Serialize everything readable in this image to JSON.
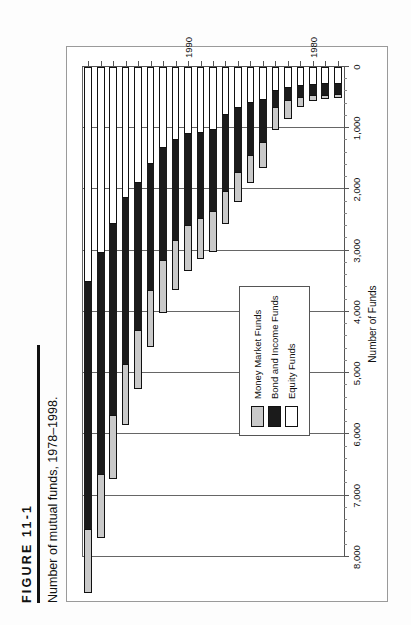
{
  "figure": {
    "number": "FIGURE 11-1",
    "caption": "Number of mutual funds, 1978–1998."
  },
  "legend": {
    "items": [
      {
        "label": "Money Market Funds",
        "color": "#c9c9c9"
      },
      {
        "label": "Bond and Income Funds",
        "color": "#1b1b1b"
      },
      {
        "label": "Equity Funds",
        "color": "#ffffff"
      }
    ]
  },
  "axes": {
    "value_title": "Number of Funds",
    "value_ticks": [
      "0",
      "1,000",
      "2,000",
      "3,000",
      "4,000",
      "5,000",
      "6,000",
      "7,000",
      "8,000"
    ],
    "category_ticks": [
      "1980",
      "1990"
    ]
  },
  "chart_data": {
    "type": "bar",
    "orientation": "horizontal",
    "stacked": true,
    "title": "Number of mutual funds, 1978–1998.",
    "xlabel": "Number of Funds",
    "ylabel": "",
    "xlim": [
      0,
      8000
    ],
    "grid": "vertical",
    "legend_position": "inside-left",
    "categories": [
      "1978",
      "1979",
      "1980",
      "1981",
      "1982",
      "1983",
      "1984",
      "1985",
      "1986",
      "1987",
      "1988",
      "1989",
      "1990",
      "1991",
      "1992",
      "1993",
      "1994",
      "1995",
      "1996",
      "1997",
      "1998"
    ],
    "series": [
      {
        "name": "Equity Funds",
        "color": "#ffffff",
        "values": [
          280,
          283,
          288,
          306,
          340,
          396,
          538,
          582,
          674,
          782,
          1026,
          1069,
          1100,
          1191,
          1325,
          1589,
          1892,
          2139,
          2570,
          3033,
          3513
        ]
      },
      {
        "name": "Bond and Income Funds",
        "color": "#1b1b1b",
        "values": [
          164,
          170,
          170,
          180,
          199,
          257,
          679,
          859,
          1041,
          1241,
          1327,
          1402,
          1486,
          1629,
          1826,
          2055,
          2398,
          2716,
          3106,
          3610,
          4031
        ]
      },
      {
        "name": "Money Market Funds",
        "color": "#c9c9c9",
        "values": [
          61,
          76,
          96,
          159,
          318,
          373,
          425,
          460,
          485,
          543,
          663,
          664,
          743,
          820,
          864,
          920,
          963,
          997,
          1043,
          1048,
          1045
        ]
      }
    ],
    "totals": [
      505,
      529,
      554,
      645,
      857,
      1026,
      1642,
      1901,
      2200,
      2566,
      3016,
      3135,
      3329,
      3640,
      4015,
      4564,
      5253,
      5852,
      6719,
      7691,
      8589
    ]
  }
}
